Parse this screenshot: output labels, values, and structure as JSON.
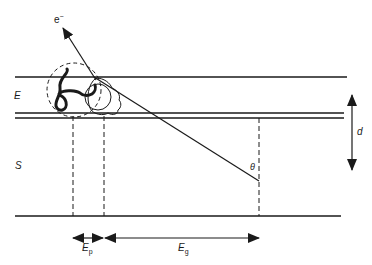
{
  "diagram": {
    "labels": {
      "electron": "e",
      "electron_charge": "−",
      "layer_e": "E",
      "layer_s": "S",
      "depth": "d",
      "angle": "θ",
      "ep_main": "E",
      "ep_sub": "p",
      "eg_main": "E",
      "eg_sub": "g"
    },
    "colors": {
      "stroke": "#1a1a1a",
      "background": "#ffffff"
    }
  }
}
